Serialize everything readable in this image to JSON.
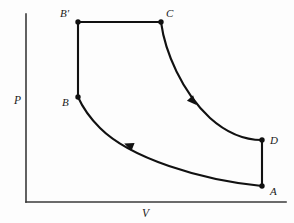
{
  "figure": {
    "kind": "pv-diagram",
    "background_color": "#fdfdfd",
    "line_color": "#111111",
    "axis_color": "#3a3a3a"
  },
  "axes": {
    "y_axis_label": "P",
    "x_axis_label": "V",
    "y_axis_label_pos": {
      "x": 14,
      "y": 104
    },
    "x_axis_label_pos": {
      "x": 142,
      "y": 217
    },
    "origin": {
      "x": 26,
      "y": 202
    },
    "y_top": 14,
    "x_right": 286
  },
  "points": [
    {
      "id": "B-prime",
      "label": "B'",
      "x": 78,
      "y": 22,
      "label_x": 60,
      "label_y": 17
    },
    {
      "id": "C",
      "label": "C",
      "x": 161,
      "y": 22,
      "label_x": 166,
      "label_y": 17
    },
    {
      "id": "B",
      "label": "B",
      "x": 78,
      "y": 97,
      "label_x": 62,
      "label_y": 106
    },
    {
      "id": "D",
      "label": "D",
      "x": 262,
      "y": 140,
      "label_x": 270,
      "label_y": 144
    },
    {
      "id": "A",
      "label": "A",
      "x": 262,
      "y": 186,
      "label_x": 270,
      "label_y": 195
    }
  ],
  "paths": [
    {
      "id": "B-prime-to-C",
      "name": "isobaric-top-segment",
      "kind": "line",
      "from": "B'",
      "to": "C",
      "d": "M 78 22 L 161 22"
    },
    {
      "id": "B-to-B-prime",
      "name": "isochoric-left-segment",
      "kind": "line",
      "from": "B",
      "to": "B'",
      "d": "M 78 97 L 78 22"
    },
    {
      "id": "C-to-D",
      "name": "adiabatic-expansion-curve",
      "kind": "curve",
      "from": "C",
      "to": "D",
      "d": "M 161 22 C 165 52, 182 92, 210 118 C 230 136, 248 140, 262 140"
    },
    {
      "id": "A-to-B",
      "name": "isothermal-compression-curve",
      "kind": "curve",
      "from": "A",
      "to": "B",
      "d": "M 262 186 C 200 180, 130 158, 100 128 C 90 118, 82 106, 78 97"
    },
    {
      "id": "D-to-A",
      "name": "isochoric-right-segment",
      "kind": "line",
      "from": "D",
      "to": "A",
      "d": "M 262 140 L 262 186"
    }
  ],
  "arrows": [
    {
      "id": "arrow-cd",
      "on_path": "C-to-D",
      "x": 190,
      "y": 98,
      "angle": 47,
      "note": "direction C to D"
    },
    {
      "id": "arrow-ab",
      "on_path": "A-to-B",
      "x": 133,
      "y": 147,
      "angle": 202,
      "note": "direction A to B"
    }
  ]
}
